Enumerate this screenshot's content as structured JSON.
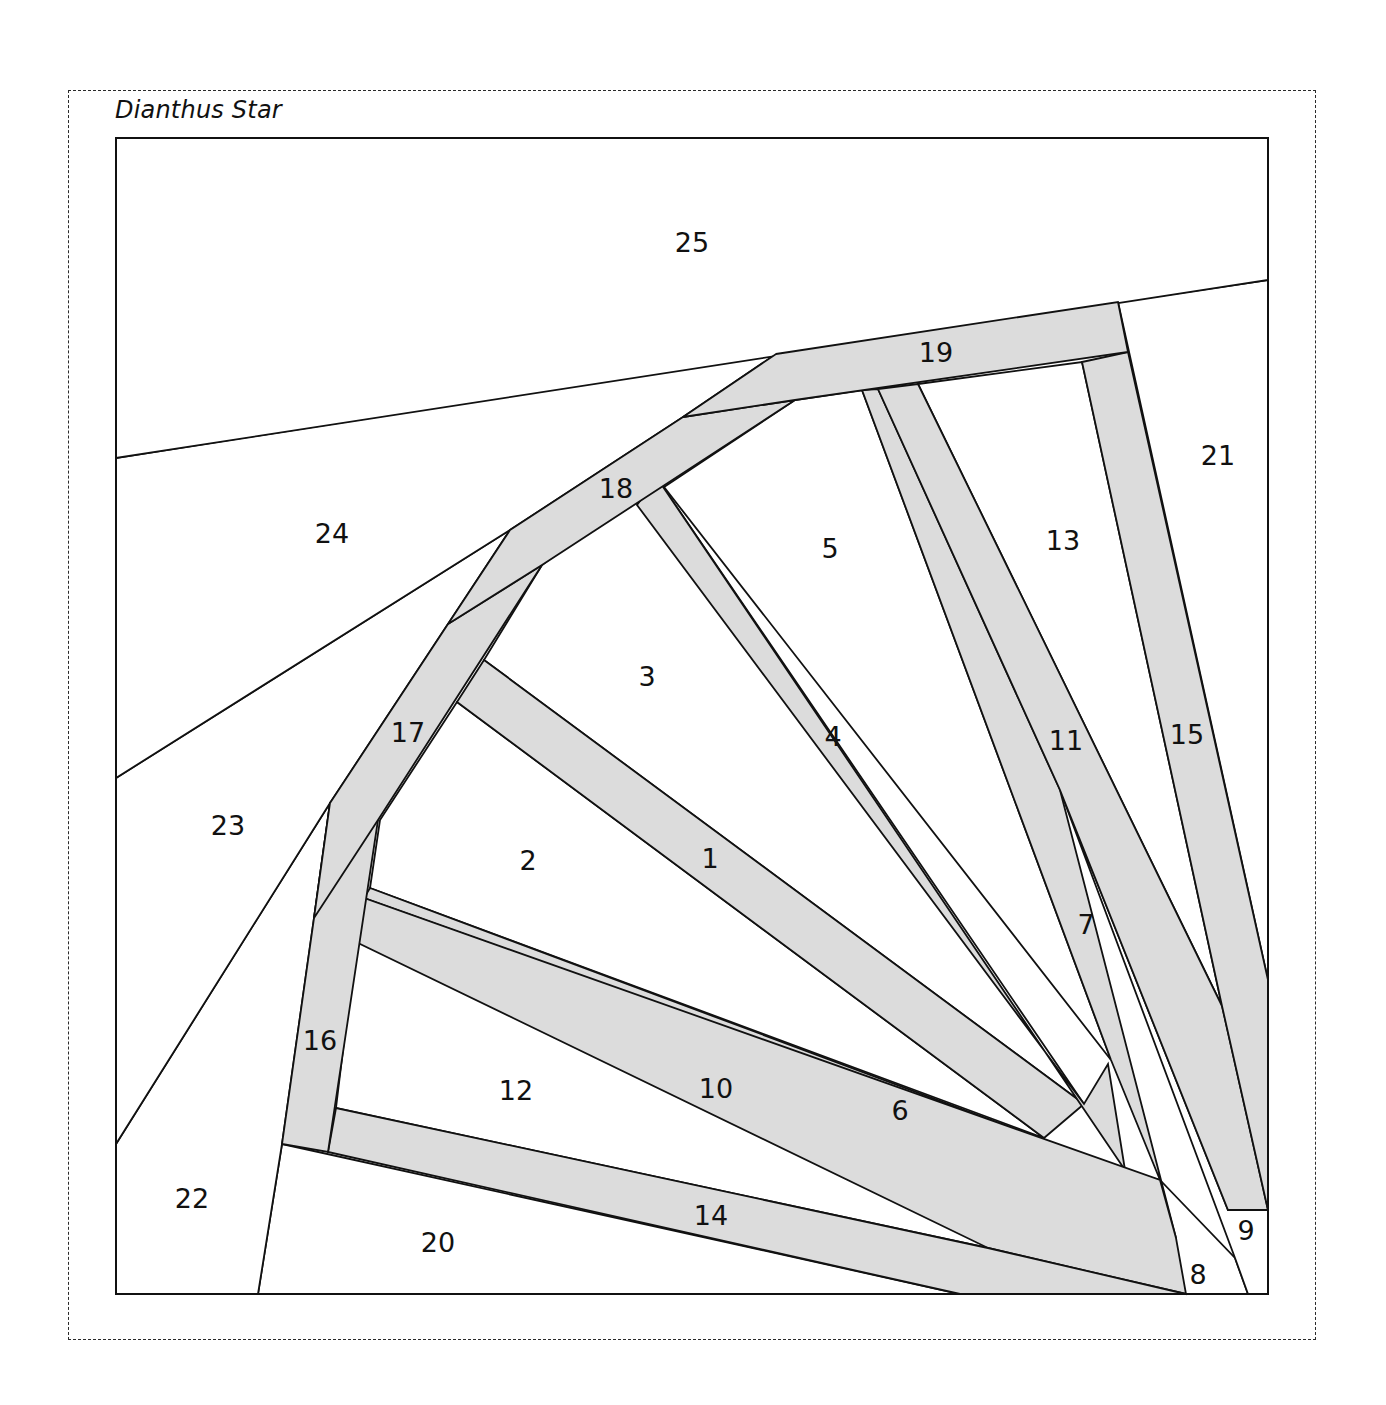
{
  "title": "Dianthus Star",
  "colors": {
    "background": "#ffffff",
    "strip": "#dcdcdc",
    "line": "#111111"
  },
  "pieces": [
    {
      "id": "1",
      "fill": "grey",
      "label_pos": [
        710,
        858
      ],
      "points": "484,660 457,702 1044,1138 1084,1104"
    },
    {
      "id": "2",
      "fill": "white",
      "label_pos": [
        528,
        860
      ],
      "points": "457,702 380,820 370,888 1044,1138"
    },
    {
      "id": "3",
      "fill": "white",
      "label_pos": [
        647,
        676
      ],
      "points": "542,565 484,660 1084,1104 657,478"
    },
    {
      "id": "4",
      "fill": "grey",
      "label_pos": [
        833,
        736
      ],
      "points": "657,478 637,505 1084,1104 1108,1064 1125,1170"
    },
    {
      "id": "5",
      "fill": "white",
      "label_pos": [
        830,
        548
      ],
      "points": "637,505 657,478 1111,1060 862,390 795,400"
    },
    {
      "id": "6",
      "fill": "grey",
      "label_pos": [
        900,
        1110
      ],
      "points": "370,888 364,898 1128,1172 1160,1180 1125,1170"
    },
    {
      "id": "7",
      "fill": "grey",
      "label_pos": [
        1086,
        924
      ],
      "points": "862,390 878,389 1060,790 1176,1238 1160,1180 1111,1060"
    },
    {
      "id": "8",
      "fill": "white",
      "label_pos": [
        1198,
        1274
      ],
      "points": "762,1080 1186,1294 1248,1294 1235,1258 1160,1180"
    },
    {
      "id": "9",
      "fill": "white",
      "label_pos": [
        1246,
        1230
      ],
      "points": "1060,790 1228,1210 1268,1210 1268,1294 1248,1294 1235,1258"
    },
    {
      "id": "10",
      "fill": "grey",
      "label_pos": [
        716,
        1088
      ],
      "points": "364,898 356,942 988,1248 1186,1294 1176,1238 1160,1180"
    },
    {
      "id": "11",
      "fill": "grey",
      "label_pos": [
        1066,
        740
      ],
      "points": "878,389 918,384 1222,1006 1268,1210 1228,1210 1060,790"
    },
    {
      "id": "12",
      "fill": "white",
      "label_pos": [
        516,
        1090
      ],
      "points": "356,942 336,1108 988,1248 762,1080"
    },
    {
      "id": "13",
      "fill": "white",
      "label_pos": [
        1063,
        540
      ],
      "points": "918,384 1082,362 1222,1006"
    },
    {
      "id": "14",
      "fill": "grey",
      "label_pos": [
        711,
        1215
      ],
      "points": "336,1108 328,1152 960,1294 1186,1294 988,1248"
    },
    {
      "id": "15",
      "fill": "grey",
      "label_pos": [
        1187,
        734
      ],
      "points": "1082,362 1128,352 1268,980 1268,1210 1222,1006"
    },
    {
      "id": "16",
      "fill": "grey",
      "label_pos": [
        320,
        1040
      ],
      "points": "330,803 378,820 328,1152 282,1144 314,918"
    },
    {
      "id": "17",
      "fill": "grey",
      "label_pos": [
        408,
        732
      ],
      "points": "448,624 542,565 378,820 314,918 330,803"
    },
    {
      "id": "18",
      "fill": "grey",
      "label_pos": [
        616,
        488
      ],
      "points": "683,417 795,400 542,565 448,624 510,530"
    },
    {
      "id": "19",
      "fill": "grey",
      "label_pos": [
        936,
        352
      ],
      "points": "776,354 1118,302 1128,352 795,400 683,417"
    },
    {
      "id": "20",
      "fill": "white",
      "label_pos": [
        438,
        1242
      ],
      "points": "282,1144 960,1294 258,1294"
    },
    {
      "id": "21",
      "fill": "white",
      "label_pos": [
        1218,
        455
      ],
      "points": "1118,302 1268,280 1268,980"
    },
    {
      "id": "22",
      "fill": "white",
      "label_pos": [
        192,
        1198
      ],
      "points": "116,1144 330,803 314,918 282,1144 258,1294 116,1294"
    },
    {
      "id": "23",
      "fill": "white",
      "label_pos": [
        228,
        825
      ],
      "points": "116,778 510,530 448,624 330,803 116,1144"
    },
    {
      "id": "24",
      "fill": "white",
      "label_pos": [
        332,
        533
      ],
      "points": "116,458 776,354 683,417 510,530 116,778"
    },
    {
      "id": "25",
      "fill": "white",
      "label_pos": [
        692,
        242
      ],
      "points": "116,138 1268,138 1268,280 116,458"
    }
  ]
}
